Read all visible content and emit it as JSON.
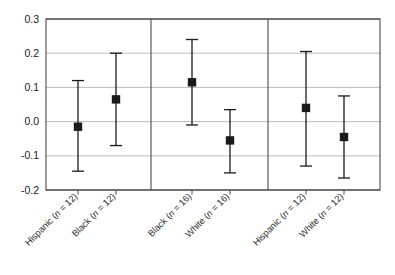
{
  "figure": {
    "type": "error-bar-plot",
    "background_color": "#ffffff",
    "frame_color": "#4a4a4a",
    "grid_color": "#b4b4b4",
    "marker_color": "#1a1a1a",
    "errorbar_color": "#1a1a1a"
  },
  "chart_data": {
    "type": "scatter",
    "title": "",
    "xlabel": "",
    "ylabel": "",
    "ylim": [
      -0.2,
      0.3
    ],
    "yticks": [
      0.3,
      0.2,
      0.1,
      0.0,
      -0.1,
      -0.2
    ],
    "ytick_labels": [
      "0.3",
      "0.2",
      "0.1",
      "0.0",
      "-0.1",
      "-0.2"
    ],
    "grid": "horizontal",
    "legend": "none",
    "panels": [
      {
        "index": 0,
        "points": [
          {
            "label": "Hispanic (n = 12)",
            "group": "Hispanic",
            "n": 12,
            "value": -0.015,
            "ci_low": -0.145,
            "ci_high": 0.12
          },
          {
            "label": "Black (n = 12)",
            "group": "Black",
            "n": 12,
            "value": 0.065,
            "ci_low": -0.07,
            "ci_high": 0.2
          }
        ]
      },
      {
        "index": 1,
        "points": [
          {
            "label": "Black (n = 16)",
            "group": "Black",
            "n": 16,
            "value": 0.115,
            "ci_low": -0.01,
            "ci_high": 0.24
          },
          {
            "label": "White (n = 16)",
            "group": "White",
            "n": 16,
            "value": -0.055,
            "ci_low": -0.15,
            "ci_high": 0.035
          }
        ]
      },
      {
        "index": 2,
        "points": [
          {
            "label": "Hispanic (n = 12)",
            "group": "Hispanic",
            "n": 12,
            "value": 0.04,
            "ci_low": -0.13,
            "ci_high": 0.205
          },
          {
            "label": "White (n = 12)",
            "group": "White",
            "n": 12,
            "value": -0.045,
            "ci_low": -0.165,
            "ci_high": 0.075
          }
        ]
      }
    ],
    "xtick_labels": [
      "Hispanic (n = 12)",
      "Black (n = 12)",
      "Black (n = 16)",
      "White (n = 16)",
      "Hispanic (n = 12)",
      "White (n = 12)"
    ],
    "xtick_label_parts": [
      {
        "prefix": "Hispanic (",
        "italic": "n",
        "suffix": " = 12)"
      },
      {
        "prefix": "Black (",
        "italic": "n",
        "suffix": " = 12)"
      },
      {
        "prefix": "Black (",
        "italic": "n",
        "suffix": " = 16)"
      },
      {
        "prefix": "White (",
        "italic": "n",
        "suffix": " = 16)"
      },
      {
        "prefix": "Hispanic (",
        "italic": "n",
        "suffix": " = 12)"
      },
      {
        "prefix": "White (",
        "italic": "n",
        "suffix": " = 12)"
      }
    ]
  }
}
